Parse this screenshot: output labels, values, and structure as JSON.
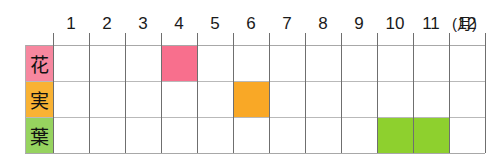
{
  "chart_data": {
    "type": "bar",
    "title": "",
    "subtitle": "",
    "xlabel": "(月)",
    "ylabel": "",
    "grid": true,
    "legend_position": "left",
    "axis_unit_label": "(月)",
    "categories": [
      "1",
      "2",
      "3",
      "4",
      "5",
      "6",
      "7",
      "8",
      "9",
      "10",
      "11",
      "12"
    ],
    "xlim": [
      1,
      12
    ],
    "rows": [
      {
        "label": "花",
        "label_romaji": "hana",
        "meaning": "flower",
        "color": "#f86f8d",
        "label_color": "#f7879f",
        "spans": [
          {
            "start_month": 4,
            "end_month": 4
          }
        ],
        "values": [
          0,
          0,
          0,
          1,
          0,
          0,
          0,
          0,
          0,
          0,
          0,
          0
        ]
      },
      {
        "label": "実",
        "label_romaji": "mi",
        "meaning": "fruit",
        "color": "#f9a826",
        "label_color": "#f9b233",
        "spans": [
          {
            "start_month": 6,
            "end_month": 6
          }
        ],
        "values": [
          0,
          0,
          0,
          0,
          0,
          1,
          0,
          0,
          0,
          0,
          0,
          0
        ]
      },
      {
        "label": "葉",
        "label_romaji": "ha",
        "meaning": "leaf",
        "color": "#8ed02e",
        "label_color": "#96d35f",
        "spans": [
          {
            "start_month": 10,
            "end_month": 11
          }
        ],
        "values": [
          0,
          0,
          0,
          0,
          0,
          0,
          0,
          0,
          0,
          1,
          1,
          0
        ]
      }
    ]
  },
  "colors": {
    "flower": "#f86f8d",
    "fruit": "#f9a826",
    "leaf": "#8ed02e",
    "grid_vertical": "#6f6f6f",
    "grid_horizontal": "#b9b9b9",
    "background": "#ffffff"
  }
}
